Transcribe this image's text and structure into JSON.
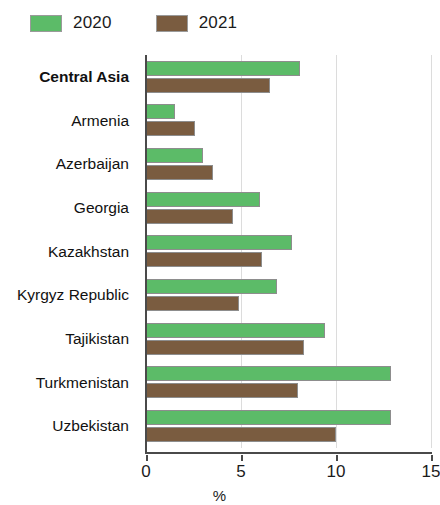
{
  "legend": {
    "position": "top-left",
    "entries": [
      {
        "label": "2020",
        "color": "#5cbb68",
        "icon": "legend-swatch-icon"
      },
      {
        "label": "2021",
        "color": "#7a5c40",
        "icon": "legend-swatch-icon"
      }
    ]
  },
  "axis": {
    "x_title": "%",
    "ticks": [
      "0",
      "5",
      "10",
      "15"
    ]
  },
  "chart_data": {
    "type": "bar",
    "orientation": "horizontal",
    "title": "",
    "subtitle": "",
    "xlabel": "%",
    "ylabel": "",
    "xlim": [
      0,
      15
    ],
    "xticks": [
      0,
      5,
      10,
      15
    ],
    "grid": true,
    "grid_axis": "x",
    "legend_position": "top-left",
    "categories": [
      "Central Asia",
      "Armenia",
      "Azerbaijan",
      "Georgia",
      "Kazakhstan",
      "Kyrgyz Republic",
      "Tajikistan",
      "Turkmenistan",
      "Uzbekistan"
    ],
    "highlighted_categories": [
      "Central Asia"
    ],
    "series": [
      {
        "name": "2020",
        "color": "#5cbb68",
        "values": [
          8.1,
          1.5,
          3.0,
          6.0,
          7.7,
          6.9,
          9.4,
          12.9,
          12.9
        ]
      },
      {
        "name": "2021",
        "color": "#7a5c40",
        "values": [
          6.5,
          2.6,
          3.5,
          4.6,
          6.1,
          4.9,
          8.3,
          8.0,
          10.0
        ]
      }
    ]
  }
}
